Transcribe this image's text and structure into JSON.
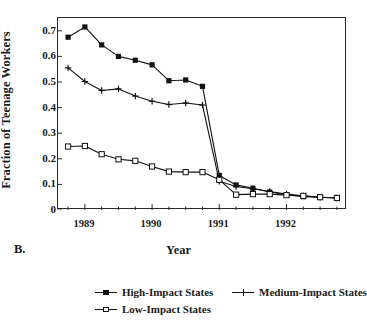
{
  "panel": {
    "label": "B."
  },
  "axes": {
    "ylabel": "Fraction of Teenage Workers",
    "xlabel": "Year",
    "yticks": [
      "0",
      "0.1",
      "0.2",
      "0.3",
      "0.4",
      "0.5",
      "0.6",
      "0.7"
    ],
    "xticklabels": [
      "1989",
      "1990",
      "1991",
      "1992"
    ]
  },
  "legend": {
    "items": [
      {
        "label": "High-Impact States",
        "marker": "filled-square-marker",
        "color": "#111111"
      },
      {
        "label": "Medium-Impact States",
        "marker": "plus-marker",
        "color": "#111111"
      },
      {
        "label": "Low-Impact States",
        "marker": "open-square-marker",
        "color": "#111111"
      }
    ]
  },
  "chart_data": {
    "type": "line",
    "title": "",
    "xlabel": "Year",
    "ylabel": "Fraction of Teenage Workers",
    "xlim": [
      1988.6,
      1992.9
    ],
    "ylim": [
      0,
      0.75
    ],
    "yticks": [
      0,
      0.1,
      0.2,
      0.3,
      0.4,
      0.5,
      0.6,
      0.7
    ],
    "xticks": [
      1989,
      1990,
      1991,
      1992
    ],
    "minor_tick_interval": 0.25,
    "grid": false,
    "legend_position": "below",
    "x": [
      1988.75,
      1989.0,
      1989.25,
      1989.5,
      1989.75,
      1990.0,
      1990.25,
      1990.5,
      1990.75,
      1991.0,
      1991.25,
      1991.5,
      1991.75,
      1992.0,
      1992.25,
      1992.5,
      1992.75
    ],
    "series": [
      {
        "name": "High-Impact States",
        "marker": "filled-square",
        "values": [
          0.675,
          0.715,
          0.645,
          0.6,
          0.585,
          0.567,
          0.505,
          0.508,
          0.483,
          0.135,
          0.098,
          0.085,
          0.07,
          0.06,
          0.052,
          0.05,
          0.048
        ]
      },
      {
        "name": "Medium-Impact States",
        "marker": "plus",
        "values": [
          0.555,
          0.502,
          0.467,
          0.473,
          0.445,
          0.425,
          0.412,
          0.418,
          0.41,
          0.112,
          0.092,
          0.083,
          0.072,
          0.062,
          0.055,
          0.05,
          0.047
        ]
      },
      {
        "name": "Low-Impact States",
        "marker": "open-square",
        "values": [
          0.248,
          0.25,
          0.218,
          0.198,
          0.192,
          0.17,
          0.15,
          0.148,
          0.148,
          0.118,
          0.06,
          0.062,
          0.062,
          0.058,
          0.055,
          0.05,
          0.047
        ]
      }
    ]
  }
}
